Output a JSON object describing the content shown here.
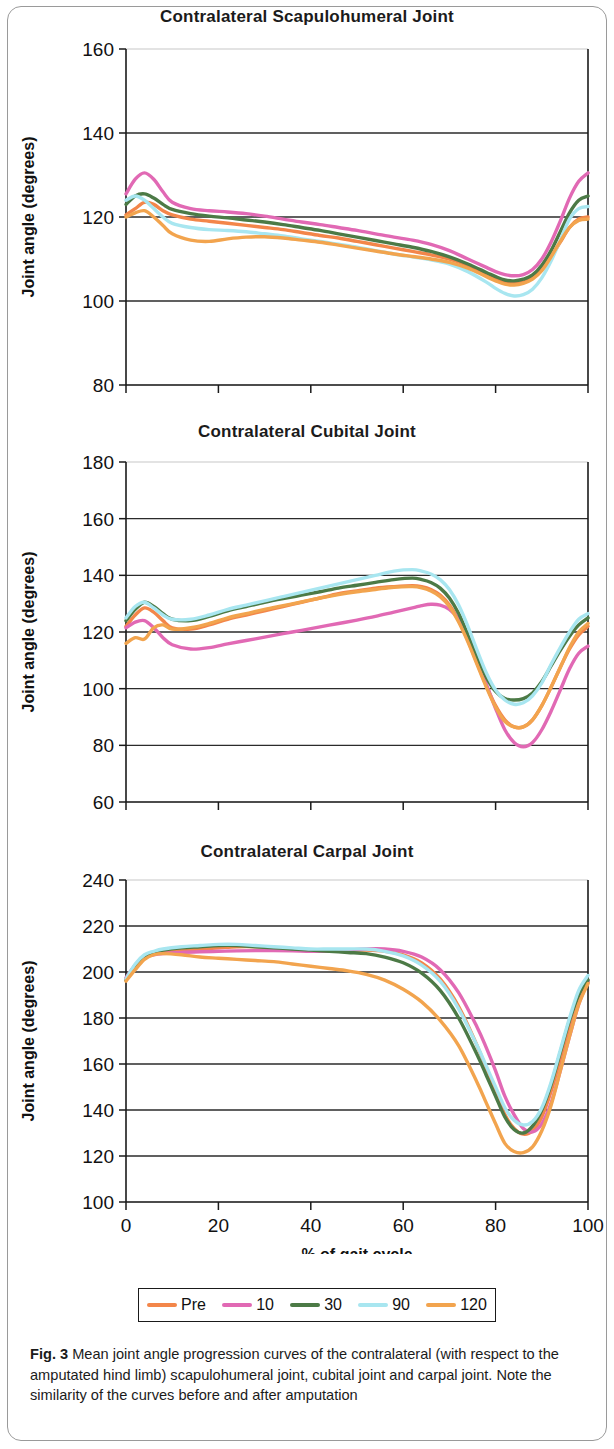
{
  "figure": {
    "label": "Fig. 3",
    "caption": "Mean joint angle progression curves of the contralateral (with respect to the amputated hind limb) scapulohumeral joint, cubital joint and carpal joint. Note the similarity of the curves before and after amputation"
  },
  "legend": {
    "position": "bottom",
    "entries": [
      {
        "label": "Pre",
        "color": "#F3864A"
      },
      {
        "label": "10",
        "color": "#E169B4"
      },
      {
        "label": "30",
        "color": "#4C7A46"
      },
      {
        "label": "90",
        "color": "#A8E6F0"
      },
      {
        "label": "120",
        "color": "#F2A44E"
      }
    ]
  },
  "axis": {
    "xlabel": "% of gait cycle",
    "ylabel": "Joint angle (degrees)"
  },
  "chart_data": [
    {
      "type": "line",
      "title": "Contralateral Scapulohumeral Joint",
      "xlabel": "",
      "ylabel": "Joint angle (degrees)",
      "xlim": [
        0,
        100
      ],
      "ylim": [
        80,
        160
      ],
      "xticks": [
        0,
        20,
        40,
        60,
        80,
        100
      ],
      "yticks": [
        80,
        100,
        120,
        140,
        160
      ],
      "xticklabels": [
        "",
        "",
        "",
        "",
        "",
        ""
      ],
      "yticklabels": [
        "80",
        "100",
        "120",
        "140",
        "160"
      ],
      "grid": true,
      "x": [
        0,
        2,
        4,
        6,
        8,
        10,
        14,
        18,
        22,
        26,
        30,
        34,
        38,
        42,
        46,
        50,
        54,
        58,
        62,
        66,
        70,
        74,
        78,
        80,
        82,
        84,
        86,
        88,
        90,
        92,
        94,
        96,
        98,
        100
      ],
      "series": [
        {
          "name": "Pre",
          "color": "#F3864A",
          "values": [
            120.5,
            122.0,
            123.5,
            123.0,
            121.5,
            120.5,
            119.5,
            119.0,
            118.5,
            118.0,
            117.5,
            117.0,
            116.3,
            115.6,
            115.0,
            114.2,
            113.4,
            112.6,
            111.8,
            111.0,
            110.0,
            108.5,
            106.5,
            105.3,
            104.5,
            104.2,
            104.5,
            105.5,
            107.5,
            110.5,
            114.0,
            117.5,
            119.5,
            120.0
          ]
        },
        {
          "name": "10",
          "color": "#E169B4",
          "values": [
            125.5,
            129.0,
            130.5,
            129.0,
            126.0,
            123.5,
            122.0,
            121.5,
            121.2,
            120.8,
            120.2,
            119.5,
            118.8,
            118.2,
            117.5,
            116.8,
            116.0,
            115.2,
            114.5,
            113.5,
            112.0,
            110.0,
            108.0,
            107.0,
            106.3,
            106.0,
            106.3,
            107.5,
            110.0,
            114.0,
            119.0,
            124.5,
            128.5,
            130.5
          ]
        },
        {
          "name": "30",
          "color": "#4C7A46",
          "values": [
            123.0,
            125.0,
            125.5,
            124.5,
            123.0,
            121.8,
            120.8,
            120.2,
            119.8,
            119.3,
            118.8,
            118.2,
            117.5,
            116.8,
            116.0,
            115.2,
            114.4,
            113.6,
            112.8,
            111.8,
            110.5,
            108.8,
            106.8,
            105.8,
            105.0,
            104.8,
            105.2,
            106.2,
            108.5,
            112.0,
            116.5,
            121.0,
            124.0,
            125.0
          ]
        },
        {
          "name": "90",
          "color": "#A8E6F0",
          "values": [
            124.0,
            125.0,
            124.0,
            122.0,
            120.0,
            118.5,
            117.5,
            117.0,
            116.8,
            116.5,
            116.0,
            115.5,
            114.8,
            114.2,
            113.5,
            112.8,
            112.0,
            111.2,
            110.5,
            109.8,
            108.8,
            107.0,
            104.5,
            103.0,
            101.8,
            101.2,
            101.5,
            102.8,
            105.5,
            109.5,
            114.5,
            119.5,
            122.0,
            122.5
          ]
        },
        {
          "name": "120",
          "color": "#F2A44E",
          "values": [
            120.0,
            121.0,
            121.5,
            120.0,
            118.0,
            116.0,
            114.5,
            114.2,
            114.8,
            115.2,
            115.3,
            115.0,
            114.5,
            114.0,
            113.3,
            112.6,
            111.9,
            111.2,
            110.6,
            110.0,
            109.2,
            107.8,
            105.8,
            104.8,
            104.0,
            103.8,
            104.2,
            105.2,
            107.2,
            110.5,
            114.2,
            117.5,
            119.2,
            119.5
          ]
        }
      ]
    },
    {
      "type": "line",
      "title": "Contralateral Cubital Joint",
      "xlabel": "",
      "ylabel": "Joint angle (degrees)",
      "xlim": [
        0,
        100
      ],
      "ylim": [
        60,
        180
      ],
      "xticks": [
        0,
        20,
        40,
        60,
        80,
        100
      ],
      "yticks": [
        60,
        80,
        100,
        120,
        140,
        160,
        180
      ],
      "xticklabels": [
        "",
        "",
        "",
        "",
        "",
        ""
      ],
      "yticklabels": [
        "60",
        "80",
        "100",
        "120",
        "140",
        "160",
        "180"
      ],
      "grid": true,
      "x": [
        0,
        2,
        4,
        6,
        8,
        10,
        14,
        18,
        22,
        26,
        30,
        34,
        38,
        42,
        46,
        50,
        54,
        58,
        62,
        64,
        66,
        68,
        70,
        72,
        74,
        76,
        78,
        80,
        82,
        84,
        86,
        88,
        90,
        92,
        94,
        96,
        98,
        100
      ],
      "series": [
        {
          "name": "Pre",
          "color": "#F3864A",
          "values": [
            122.0,
            126.0,
            128.5,
            127.0,
            124.0,
            121.5,
            121.0,
            122.5,
            124.5,
            126.0,
            127.5,
            129.0,
            130.5,
            132.0,
            133.5,
            134.5,
            135.5,
            136.0,
            136.3,
            136.0,
            135.0,
            133.0,
            129.5,
            124.0,
            117.0,
            109.0,
            101.0,
            94.0,
            89.0,
            86.5,
            86.5,
            89.0,
            94.0,
            100.5,
            107.5,
            114.0,
            119.0,
            122.0
          ]
        },
        {
          "name": "10",
          "color": "#E169B4",
          "values": [
            121.5,
            123.5,
            124.0,
            121.5,
            118.0,
            115.5,
            114.0,
            114.5,
            115.8,
            117.0,
            118.2,
            119.4,
            120.6,
            121.8,
            123.0,
            124.2,
            125.5,
            127.0,
            128.5,
            129.3,
            129.8,
            129.5,
            128.0,
            124.5,
            118.5,
            110.5,
            101.5,
            93.0,
            85.5,
            81.0,
            79.5,
            81.0,
            85.5,
            92.0,
            99.5,
            107.0,
            112.5,
            115.0
          ]
        },
        {
          "name": "30",
          "color": "#4C7A46",
          "values": [
            124.0,
            128.0,
            130.5,
            129.0,
            126.5,
            124.5,
            124.0,
            125.5,
            127.5,
            129.0,
            130.5,
            131.8,
            133.0,
            134.2,
            135.5,
            136.5,
            137.5,
            138.5,
            139.0,
            138.5,
            137.5,
            135.5,
            132.0,
            126.5,
            119.0,
            111.0,
            104.0,
            99.0,
            96.5,
            96.0,
            96.5,
            98.5,
            102.5,
            108.0,
            113.5,
            118.5,
            122.5,
            125.0
          ]
        },
        {
          "name": "90",
          "color": "#A8E6F0",
          "values": [
            125.0,
            129.0,
            130.5,
            128.5,
            126.0,
            124.5,
            124.5,
            126.0,
            128.0,
            129.5,
            131.0,
            132.5,
            134.0,
            135.5,
            137.0,
            138.5,
            140.0,
            141.5,
            142.0,
            141.5,
            140.5,
            138.5,
            135.0,
            129.5,
            122.0,
            113.5,
            105.5,
            99.5,
            96.0,
            94.5,
            95.0,
            97.5,
            102.0,
            108.5,
            114.5,
            120.0,
            124.5,
            126.5
          ]
        },
        {
          "name": "120",
          "color": "#F2A44E",
          "values": [
            116.0,
            118.0,
            117.5,
            121.5,
            122.5,
            121.0,
            121.5,
            123.0,
            125.0,
            126.5,
            128.0,
            129.3,
            130.6,
            132.0,
            133.2,
            134.2,
            135.0,
            135.8,
            136.0,
            135.6,
            134.5,
            132.5,
            129.0,
            123.5,
            116.5,
            108.5,
            100.5,
            93.5,
            88.5,
            86.5,
            86.5,
            89.0,
            94.0,
            100.5,
            107.5,
            114.5,
            120.0,
            123.0
          ]
        }
      ]
    },
    {
      "type": "line",
      "title": "Contralateral Carpal Joint",
      "xlabel": "% of gait cycle",
      "ylabel": "Joint angle (degrees)",
      "xlim": [
        0,
        100
      ],
      "ylim": [
        100,
        240
      ],
      "xticks": [
        0,
        20,
        40,
        60,
        80,
        100
      ],
      "yticks": [
        100,
        120,
        140,
        160,
        180,
        200,
        220,
        240
      ],
      "xticklabels": [
        "0",
        "20",
        "40",
        "60",
        "80",
        "100"
      ],
      "yticklabels": [
        "100",
        "120",
        "140",
        "160",
        "180",
        "200",
        "220",
        "240"
      ],
      "grid": true,
      "x": [
        0,
        2,
        4,
        6,
        8,
        12,
        16,
        20,
        24,
        28,
        32,
        36,
        40,
        44,
        48,
        52,
        56,
        60,
        64,
        68,
        72,
        76,
        78,
        80,
        82,
        84,
        86,
        88,
        90,
        92,
        94,
        96,
        98,
        100
      ],
      "series": [
        {
          "name": "Pre",
          "color": "#F3864A",
          "values": [
            197.0,
            203.0,
            207.0,
            208.5,
            209.0,
            209.5,
            210.0,
            210.5,
            211.0,
            211.0,
            210.5,
            210.0,
            209.5,
            209.5,
            209.5,
            209.5,
            209.0,
            207.5,
            204.0,
            197.0,
            185.0,
            168.0,
            158.0,
            148.0,
            138.0,
            132.0,
            129.5,
            131.0,
            137.0,
            148.0,
            162.0,
            176.0,
            188.0,
            195.5
          ]
        },
        {
          "name": "10",
          "color": "#E169B4",
          "values": [
            197.5,
            203.0,
            206.5,
            207.5,
            208.0,
            208.5,
            208.8,
            209.0,
            209.2,
            209.3,
            209.3,
            209.2,
            209.0,
            209.0,
            209.5,
            210.0,
            210.0,
            209.0,
            206.5,
            201.0,
            191.0,
            176.0,
            167.0,
            157.0,
            146.0,
            138.0,
            132.0,
            130.5,
            134.0,
            143.0,
            157.0,
            172.0,
            186.0,
            196.0
          ]
        },
        {
          "name": "30",
          "color": "#4C7A46",
          "values": [
            196.5,
            202.5,
            206.5,
            208.5,
            209.5,
            210.5,
            211.0,
            211.5,
            211.5,
            211.0,
            210.5,
            210.0,
            209.5,
            209.0,
            208.5,
            208.0,
            206.5,
            204.0,
            199.5,
            192.0,
            180.0,
            164.0,
            155.0,
            146.0,
            137.0,
            131.5,
            130.0,
            133.0,
            140.0,
            151.0,
            165.0,
            179.0,
            190.0,
            196.5
          ]
        },
        {
          "name": "90",
          "color": "#A8E6F0",
          "values": [
            197.0,
            203.5,
            207.5,
            209.0,
            210.0,
            211.0,
            211.5,
            212.0,
            212.0,
            211.5,
            211.0,
            210.5,
            210.0,
            210.0,
            210.0,
            210.0,
            209.0,
            207.0,
            203.0,
            196.0,
            184.0,
            168.0,
            159.0,
            150.0,
            141.0,
            135.5,
            133.5,
            135.0,
            141.0,
            152.0,
            166.0,
            180.0,
            192.0,
            198.5
          ]
        },
        {
          "name": "120",
          "color": "#F2A44E",
          "values": [
            196.0,
            201.0,
            205.5,
            207.5,
            208.0,
            207.5,
            206.5,
            206.0,
            205.5,
            205.0,
            204.5,
            203.5,
            202.5,
            201.5,
            200.5,
            199.0,
            196.5,
            192.5,
            187.0,
            179.0,
            168.0,
            152.0,
            143.0,
            134.0,
            125.5,
            122.0,
            121.5,
            124.0,
            131.0,
            142.0,
            157.0,
            172.0,
            186.0,
            195.0
          ]
        }
      ]
    }
  ]
}
